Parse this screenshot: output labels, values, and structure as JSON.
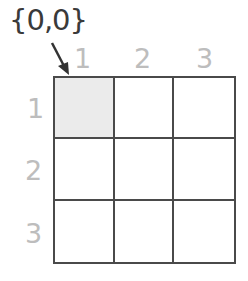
{
  "origin_label": "{0,0}",
  "columns": [
    "1",
    "2",
    "3"
  ],
  "rows": [
    "1",
    "2",
    "3"
  ],
  "highlighted_cell": {
    "row": 1,
    "col": 1
  },
  "colors": {
    "grid_line": "#4a4a4a",
    "header_text": "#bdbdbd",
    "origin_text": "#3a3a3a",
    "highlight_fill": "#ebebeb"
  }
}
